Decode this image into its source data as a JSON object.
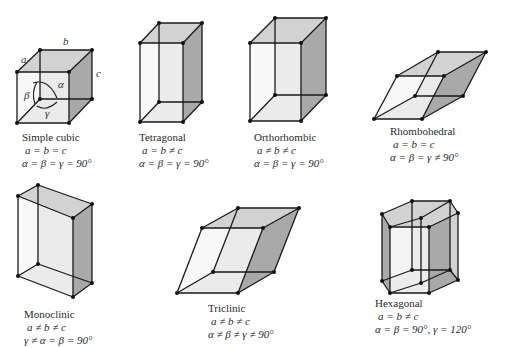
{
  "figure": {
    "lattices": [
      {
        "id": "simple-cubic",
        "name": "Simple cubic",
        "lengths": "a = b = c",
        "angles": "α = β = γ = 90°"
      },
      {
        "id": "tetragonal",
        "name": "Tetragonal",
        "lengths": "a = b ≠ c",
        "angles": "α = β = γ = 90°"
      },
      {
        "id": "orthorhombic",
        "name": "Orthorhombic",
        "lengths": "a ≠ b ≠ c",
        "angles": "α = β = γ = 90°"
      },
      {
        "id": "rhombohedral",
        "name": "Rhombohedral",
        "lengths": "a = b = c",
        "angles": "α = β = γ ≠ 90°"
      },
      {
        "id": "monoclinic",
        "name": "Monoclinic",
        "lengths": "a ≠ b ≠ c",
        "angles": "γ ≠ α = β = 90°"
      },
      {
        "id": "triclinic",
        "name": "Triclinic",
        "lengths": "a ≠ b ≠ c",
        "angles": "α ≠ β ≠ γ ≠ 90°"
      },
      {
        "id": "hexagonal",
        "name": "Hexagonal",
        "lengths": "a = b ≠ c",
        "angles": "α = β = 90°, γ = 120°"
      }
    ],
    "cubic_labels": {
      "a": "a",
      "b": "b",
      "c": "c",
      "alpha": "α",
      "beta": "β",
      "gamma": "γ"
    },
    "colors": {
      "light_face": "#ececec",
      "mid_face": "#d2d2d2",
      "dark_face": "#a9a9a9",
      "edge": "#1a1a1a"
    }
  }
}
